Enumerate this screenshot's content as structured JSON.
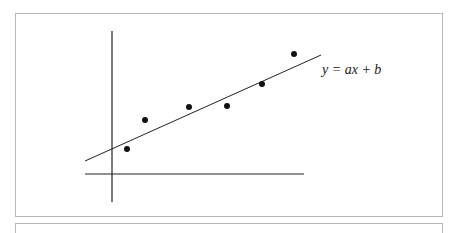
{
  "chart_data": {
    "type": "scatter",
    "title": "",
    "xlabel": "",
    "ylabel": "",
    "points": [
      {
        "x": 127,
        "y": 149
      },
      {
        "x": 145,
        "y": 120
      },
      {
        "x": 189,
        "y": 107
      },
      {
        "x": 227,
        "y": 106
      },
      {
        "x": 262,
        "y": 84
      },
      {
        "x": 294,
        "y": 54
      }
    ],
    "fit_line": {
      "label": "y = ax + b",
      "x1": 85,
      "y1": 161,
      "x2": 321,
      "y2": 55
    },
    "axes": {
      "y_axis": {
        "x": 112,
        "y1": 31,
        "y2": 202
      },
      "x_axis": {
        "y": 174,
        "x1": 85,
        "x2": 304
      }
    },
    "grid": false,
    "legend": "none"
  },
  "annotation": {
    "equation": "y = ax + b"
  },
  "colors": {
    "ink": "#111111",
    "frame": "#b8b8b8"
  }
}
